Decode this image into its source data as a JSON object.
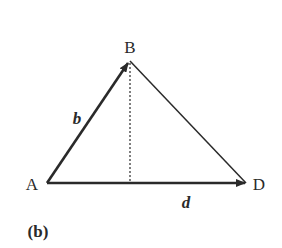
{
  "diagram": {
    "points": {
      "A": {
        "label": "A",
        "x": 47,
        "y": 183
      },
      "B": {
        "label": "B",
        "x": 130,
        "y": 61
      },
      "D": {
        "label": "D",
        "x": 246,
        "y": 183
      }
    },
    "vectors": [
      {
        "name": "b",
        "label": "b",
        "from": "A",
        "to": "B"
      },
      {
        "name": "d",
        "label": "d",
        "from": "A",
        "to": "D"
      }
    ],
    "segments": [
      {
        "from": "B",
        "to": "D",
        "style": "solid"
      },
      {
        "from": "B",
        "to": "foot",
        "style": "dotted"
      }
    ],
    "caption": "(b)",
    "colors": {
      "stroke": "#2a2a2a",
      "background": "#ffffff"
    }
  }
}
